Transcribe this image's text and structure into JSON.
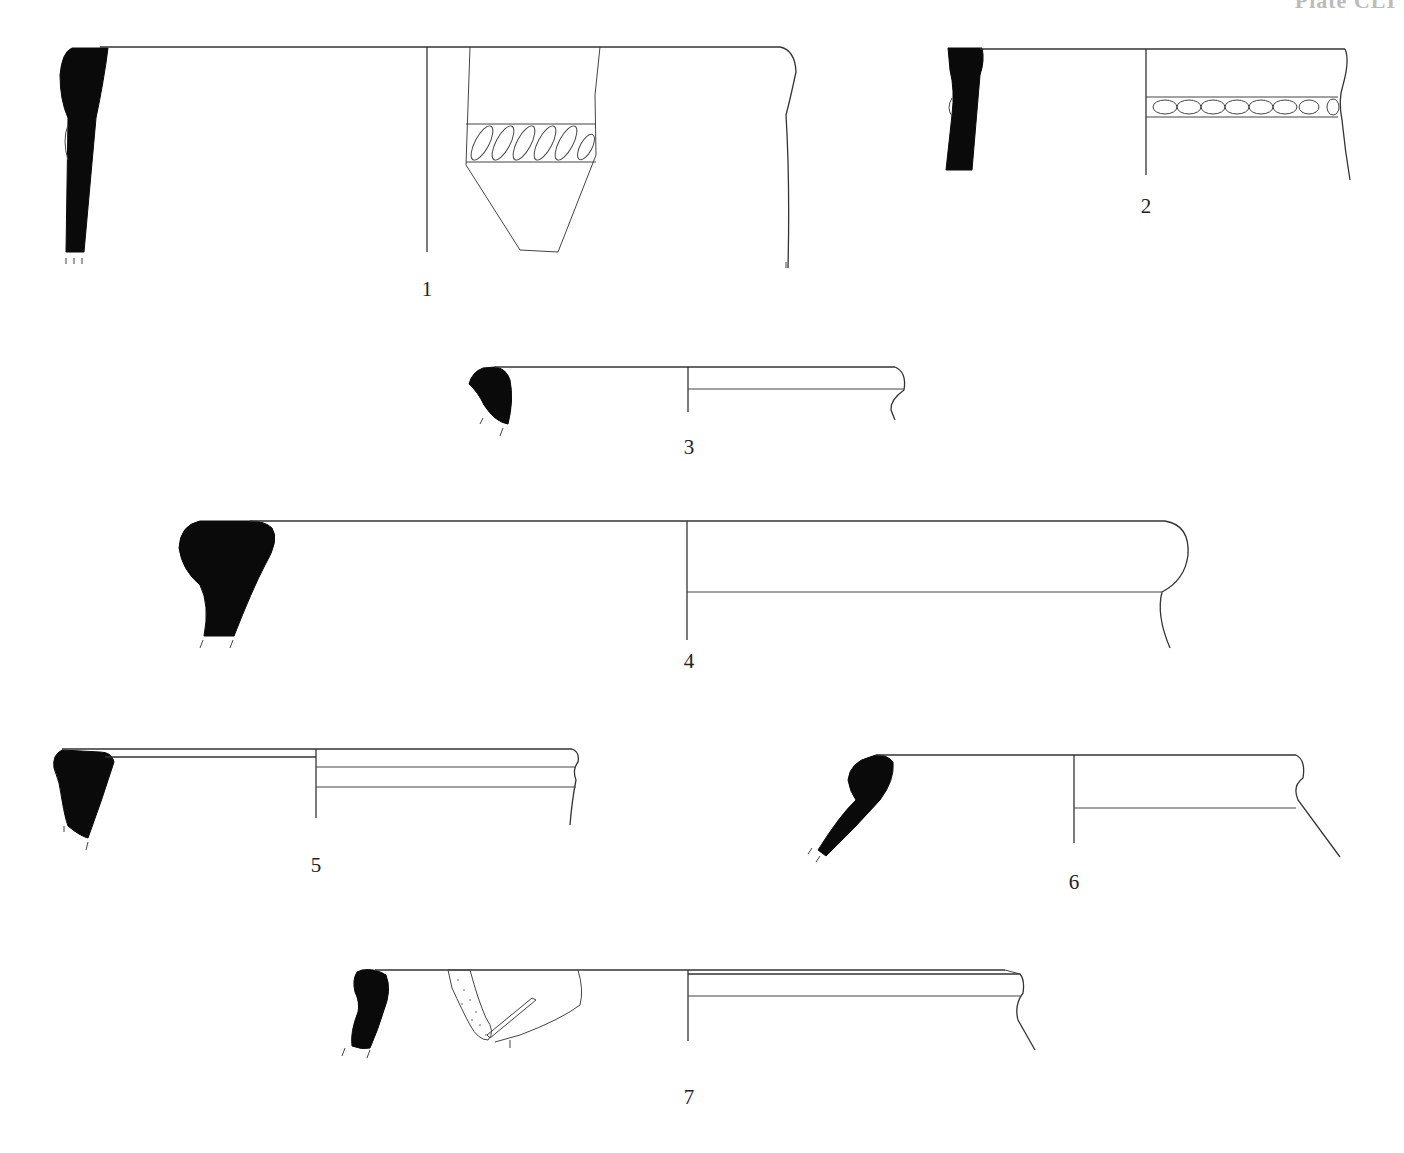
{
  "plate": {
    "header": "Plate CLI",
    "type": "pottery rim profiles (section + elevation)",
    "colors": {
      "section_fill": "#0a0a0a",
      "line": "#333333",
      "background": "#ffffff"
    }
  },
  "figures": [
    {
      "number": "1",
      "description": "tall jar rim with diagonal rope-impressed band on sherd"
    },
    {
      "number": "2",
      "description": "jar rim with oval-impressed cordon band"
    },
    {
      "number": "3",
      "description": "small rounded rim"
    },
    {
      "number": "4",
      "description": "large thickened rounded rim"
    },
    {
      "number": "5",
      "description": "rim with grooves"
    },
    {
      "number": "6",
      "description": "everted bead rim"
    },
    {
      "number": "7",
      "description": "rim with stippled handle attachment"
    }
  ]
}
